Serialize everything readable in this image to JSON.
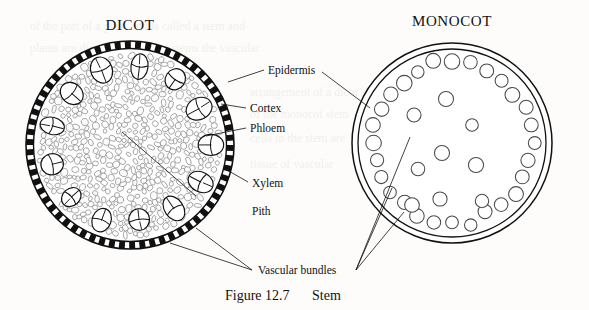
{
  "figure": {
    "caption_number": "Figure 12.7",
    "caption_title": "Stem",
    "background_color": "#fdfcfa",
    "ink_color": "#111111"
  },
  "panels": [
    {
      "id": "dicot",
      "title": "DICOT",
      "center": [
        130,
        145
      ],
      "radius": 104,
      "description": "Dicot stem cross-section: brick-like epidermis ring, dense parenchyma cortex and pith, ring of vascular bundles",
      "epidermis_segments": 62,
      "vascular_bundle_count": 13,
      "bundle_ring_radius": 78,
      "cortex_cell_count": 430
    },
    {
      "id": "monocot",
      "title": "MONOCOT",
      "center": [
        452,
        143
      ],
      "radius": 100,
      "description": "Monocot stem cross-section: double-line epidermis, scattered vascular bundles drawn as open circles",
      "outer_ring_bundle_count": 28,
      "outer_ring_radius": 80,
      "scattered_bundle_count": 9,
      "bundle_circle_radius": 7
    }
  ],
  "labels": [
    {
      "name": "epidermis",
      "text": "Epidermis",
      "x": 268,
      "y": 70
    },
    {
      "name": "cortex",
      "text": "Cortex",
      "x": 250,
      "y": 108
    },
    {
      "name": "phloem",
      "text": "Phloem",
      "x": 250,
      "y": 128
    },
    {
      "name": "xylem",
      "text": "Xylem",
      "x": 250,
      "y": 186
    },
    {
      "name": "pith",
      "text": "Pith",
      "x": 250,
      "y": 214
    },
    {
      "name": "vascular-bundles",
      "text": "Vascular bundles",
      "x": 258,
      "y": 272
    }
  ],
  "chart_data": {
    "type": "diagram",
    "title": "Figure 12.7  Stem",
    "panels": [
      "DICOT",
      "MONOCOT"
    ],
    "annotations": [
      "Epidermis",
      "Cortex",
      "Phloem",
      "Xylem",
      "Pith",
      "Vascular bundles"
    ]
  }
}
